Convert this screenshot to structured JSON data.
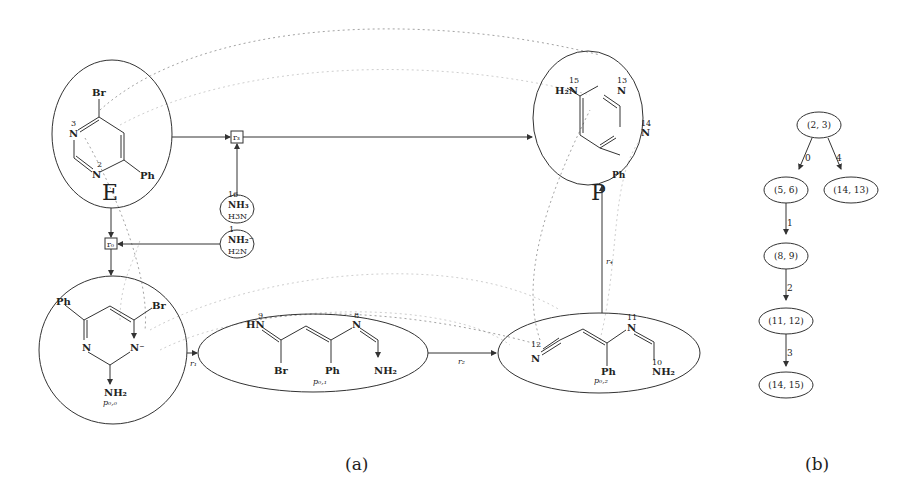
{
  "panel_a": {
    "caption": "(a)",
    "molecules": {
      "E": {
        "label": "E",
        "atoms": {
          "br": "Br",
          "n3": "N",
          "n3_num": "3",
          "n2": "N",
          "n2_num": "2",
          "ph": "Ph"
        }
      },
      "P": {
        "label": "P",
        "atoms": {
          "h2n": "H₂N",
          "n15_num": "15",
          "n13": "N",
          "n13_num": "13",
          "n14": "N",
          "n14_num": "14",
          "ph": "Ph"
        }
      },
      "p00": {
        "label": "p₀,₀",
        "atoms": {
          "ph": "Ph",
          "br": "Br",
          "n_left": "N",
          "n_right": "N⁻",
          "nh2": "NH₂"
        }
      },
      "p01": {
        "label": "p₀,₁",
        "atoms": {
          "hn": "HN",
          "hn_num": "9",
          "n8": "N",
          "n8_num": "8",
          "br": "Br",
          "ph": "Ph",
          "nh2": "NH₂"
        }
      },
      "p02": {
        "label": "p₀,₂",
        "atoms": {
          "n12": "N",
          "n12_num": "12",
          "n11": "N",
          "n11_num": "11",
          "ph": "Ph",
          "nh2": "NH₂",
          "n10_num": "10"
        }
      }
    },
    "reagents": [
      {
        "id": "nh3",
        "num": "16",
        "formula": "NH₃",
        "name": "H3N"
      },
      {
        "id": "nh2",
        "num": "1",
        "formula": "NH₂⁻",
        "name": "H2N"
      }
    ],
    "reactions": {
      "r0": "r₀",
      "r1": "r₁",
      "r2": "r₂",
      "r3": "r₃",
      "r4": "r₄"
    }
  },
  "panel_b": {
    "caption": "(b)",
    "nodes": [
      {
        "id": "n23",
        "label": "(2, 3)"
      },
      {
        "id": "n56",
        "label": "(5, 6)"
      },
      {
        "id": "n1413",
        "label": "(14, 13)"
      },
      {
        "id": "n89",
        "label": "(8, 9)"
      },
      {
        "id": "n1112",
        "label": "(11, 12)"
      },
      {
        "id": "n1415",
        "label": "(14, 15)"
      }
    ],
    "edges": [
      {
        "from": "(2, 3)",
        "to": "(5, 6)",
        "label": "0"
      },
      {
        "from": "(2, 3)",
        "to": "(14, 13)",
        "label": "4"
      },
      {
        "from": "(5, 6)",
        "to": "(8, 9)",
        "label": "1"
      },
      {
        "from": "(8, 9)",
        "to": "(11, 12)",
        "label": "2"
      },
      {
        "from": "(11, 12)",
        "to": "(14, 15)",
        "label": "3"
      }
    ]
  }
}
